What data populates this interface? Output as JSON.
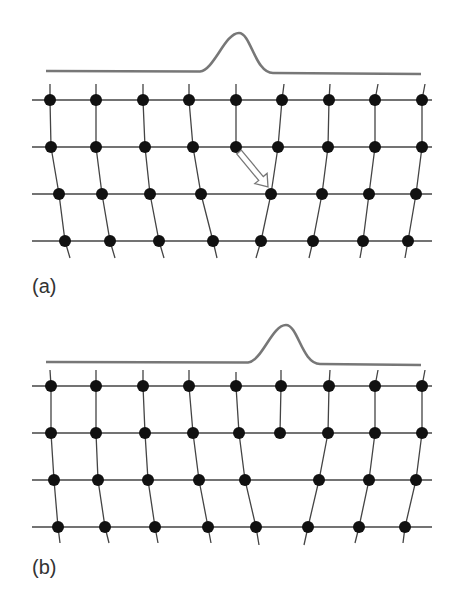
{
  "colors": {
    "curve": "#777777",
    "line": "#444444",
    "atom": "#111111",
    "arrow_stroke": "#777777",
    "arrow_fill": "#ffffff"
  },
  "panels": [
    {
      "label": "(a)",
      "label_pos": [
        32,
        302
      ],
      "curve": {
        "x0": 46,
        "x1": 421,
        "y_left": 71,
        "y_right": 74,
        "peak_x": 239,
        "peak_y": 33,
        "rise_start": 200,
        "fall_end": 273
      },
      "rows": [
        {
          "y": 100,
          "xs": [
            50,
            96,
            143,
            189,
            236,
            282,
            329,
            375,
            422
          ]
        },
        {
          "y": 147,
          "xs": [
            51,
            96,
            145,
            193,
            236,
            278,
            328,
            375,
            422
          ]
        },
        {
          "y": 194,
          "xs": [
            59,
            102,
            150,
            201,
            271,
            322,
            369,
            416
          ]
        },
        {
          "y": 241,
          "xs": [
            65,
            110,
            159,
            213,
            261,
            313,
            363,
            408
          ]
        }
      ],
      "columns": [
        [
          [
            50,
            84
          ],
          [
            50,
            100
          ],
          [
            51,
            147
          ],
          [
            59,
            194
          ],
          [
            65,
            241
          ],
          [
            70,
            258
          ]
        ],
        [
          [
            96,
            84
          ],
          [
            96,
            100
          ],
          [
            96,
            147
          ],
          [
            102,
            194
          ],
          [
            110,
            241
          ],
          [
            115,
            258
          ]
        ],
        [
          [
            143,
            84
          ],
          [
            143,
            100
          ],
          [
            145,
            147
          ],
          [
            150,
            194
          ],
          [
            159,
            241
          ],
          [
            164,
            258
          ]
        ],
        [
          [
            189,
            84
          ],
          [
            189,
            100
          ],
          [
            193,
            147
          ],
          [
            201,
            194
          ],
          [
            213,
            241
          ],
          [
            217,
            258
          ]
        ],
        [
          [
            236,
            84
          ],
          [
            236,
            100
          ],
          [
            236,
            147
          ]
        ],
        [
          [
            284,
            84
          ],
          [
            282,
            100
          ],
          [
            278,
            147
          ],
          [
            271,
            194
          ],
          [
            261,
            241
          ],
          [
            256,
            258
          ]
        ],
        [
          [
            330,
            84
          ],
          [
            329,
            100
          ],
          [
            328,
            147
          ],
          [
            322,
            194
          ],
          [
            313,
            241
          ],
          [
            309,
            258
          ]
        ],
        [
          [
            378,
            84
          ],
          [
            375,
            100
          ],
          [
            375,
            147
          ],
          [
            369,
            194
          ],
          [
            363,
            241
          ],
          [
            360,
            258
          ]
        ],
        [
          [
            425,
            84
          ],
          [
            422,
            100
          ],
          [
            422,
            147
          ],
          [
            416,
            194
          ],
          [
            408,
            241
          ],
          [
            405,
            258
          ]
        ]
      ],
      "arrow": {
        "from": [
          239,
          152
        ],
        "to": [
          268,
          187
        ]
      }
    },
    {
      "label": "(b)",
      "label_pos": [
        32,
        583
      ],
      "curve": {
        "x0": 46,
        "x1": 421,
        "y_left": 362,
        "y_right": 365,
        "peak_x": 286,
        "peak_y": 325,
        "rise_start": 248,
        "fall_end": 320
      },
      "rows": [
        {
          "y": 386,
          "xs": [
            51,
            96,
            143,
            189,
            236,
            281,
            329,
            375,
            422
          ]
        },
        {
          "y": 433,
          "xs": [
            51,
            96,
            145,
            193,
            239,
            280,
            328,
            375,
            422
          ]
        },
        {
          "y": 480,
          "xs": [
            54,
            98,
            148,
            199,
            245,
            319,
            369,
            416
          ]
        },
        {
          "y": 527,
          "xs": [
            58,
            105,
            155,
            208,
            256,
            308,
            359,
            405
          ]
        }
      ],
      "columns": [
        [
          [
            50,
            370
          ],
          [
            51,
            386
          ],
          [
            51,
            433
          ],
          [
            54,
            480
          ],
          [
            58,
            527
          ],
          [
            60,
            543
          ]
        ],
        [
          [
            96,
            370
          ],
          [
            96,
            386
          ],
          [
            96,
            433
          ],
          [
            98,
            480
          ],
          [
            105,
            527
          ],
          [
            109,
            543
          ]
        ],
        [
          [
            143,
            370
          ],
          [
            143,
            386
          ],
          [
            145,
            433
          ],
          [
            148,
            480
          ],
          [
            155,
            527
          ],
          [
            158,
            543
          ]
        ],
        [
          [
            189,
            370
          ],
          [
            189,
            386
          ],
          [
            193,
            433
          ],
          [
            199,
            480
          ],
          [
            208,
            527
          ],
          [
            211,
            543
          ]
        ],
        [
          [
            236,
            372
          ],
          [
            236,
            386
          ],
          [
            239,
            433
          ],
          [
            245,
            480
          ],
          [
            256,
            527
          ],
          [
            259,
            545
          ]
        ],
        [
          [
            281,
            370
          ],
          [
            281,
            386
          ],
          [
            280,
            433
          ]
        ],
        [
          [
            330,
            370
          ],
          [
            329,
            386
          ],
          [
            328,
            433
          ],
          [
            319,
            480
          ],
          [
            308,
            527
          ],
          [
            304,
            545
          ]
        ],
        [
          [
            378,
            370
          ],
          [
            375,
            386
          ],
          [
            375,
            433
          ],
          [
            369,
            480
          ],
          [
            359,
            527
          ],
          [
            355,
            543
          ]
        ],
        [
          [
            425,
            370
          ],
          [
            422,
            386
          ],
          [
            422,
            433
          ],
          [
            416,
            480
          ],
          [
            405,
            527
          ],
          [
            403,
            543
          ]
        ]
      ],
      "arrow": null
    }
  ],
  "line_x_range": [
    32,
    432
  ],
  "atom_radius": 6
}
